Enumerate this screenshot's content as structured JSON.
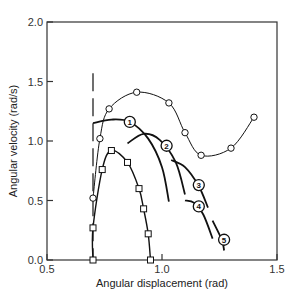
{
  "chart_data": {
    "type": "line",
    "title": "",
    "xlabel": "Angular displacement (rad)",
    "ylabel": "Angular velocity (rad/s)",
    "xlim": [
      0.5,
      1.5
    ],
    "ylim": [
      0.0,
      2.0
    ],
    "xticks": [
      "0.5",
      "1.0",
      "1.5"
    ],
    "yticks": [
      "0.0",
      "0.5",
      "1.0",
      "1.5",
      "2.0"
    ],
    "grid": false,
    "legend": "none",
    "series": [
      {
        "name": "open circles",
        "marker": "circle",
        "x": [
          0.7,
          0.73,
          0.77,
          0.89,
          1.03,
          1.1,
          1.17,
          1.3,
          1.4
        ],
        "y": [
          0.52,
          1.02,
          1.27,
          1.41,
          1.32,
          1.07,
          0.88,
          0.94,
          1.2
        ]
      },
      {
        "name": "open squares",
        "marker": "square",
        "x": [
          0.7,
          0.7,
          0.74,
          0.78,
          0.85,
          0.9,
          0.92,
          0.94,
          0.95
        ],
        "y": [
          0.0,
          0.27,
          0.76,
          0.92,
          0.82,
          0.6,
          0.43,
          0.22,
          0.0
        ]
      },
      {
        "name": "1",
        "marker": "none",
        "x": [
          0.7,
          0.78,
          0.86,
          0.94,
          1.0,
          1.03
        ],
        "y": [
          1.15,
          1.18,
          1.16,
          1.02,
          0.78,
          0.49
        ]
      },
      {
        "name": "2",
        "marker": "none",
        "x": [
          0.85,
          0.92,
          0.99,
          1.06,
          1.1
        ],
        "y": [
          0.98,
          1.06,
          1.01,
          0.82,
          0.55
        ]
      },
      {
        "name": "3",
        "marker": "none",
        "x": [
          1.04,
          1.1,
          1.16,
          1.2
        ],
        "y": [
          0.84,
          0.78,
          0.62,
          0.44
        ]
      },
      {
        "name": "4",
        "marker": "none",
        "x": [
          1.1,
          1.14,
          1.18,
          1.22
        ],
        "y": [
          0.5,
          0.48,
          0.38,
          0.18
        ]
      },
      {
        "name": "5",
        "marker": "none",
        "x": [
          1.22,
          1.26,
          1.27
        ],
        "y": [
          0.33,
          0.17,
          0.08
        ]
      }
    ],
    "annotations": [
      {
        "text": "1",
        "x": 0.86,
        "y": 1.16
      },
      {
        "text": "2",
        "x": 1.02,
        "y": 0.96
      },
      {
        "text": "3",
        "x": 1.16,
        "y": 0.63
      },
      {
        "text": "4",
        "x": 1.16,
        "y": 0.45
      },
      {
        "text": "5",
        "x": 1.27,
        "y": 0.17
      }
    ],
    "vertical_dashed_line": {
      "x": 0.7,
      "y_from": 0.0,
      "y_to": 1.57
    }
  }
}
